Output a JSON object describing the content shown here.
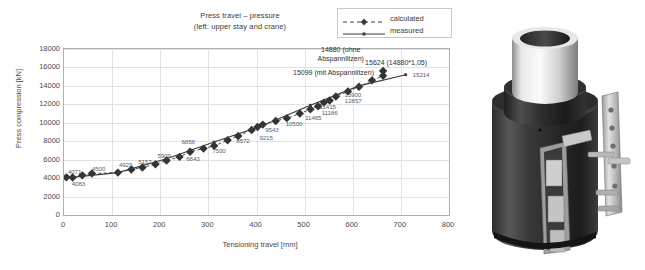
{
  "chart_data": {
    "type": "line",
    "title": "Press travel – pressure",
    "subtitle": "(left: upper stay and crane)",
    "xlabel": "Tensioning travel [mm]",
    "ylabel": "Press compression [kN]",
    "xlim": [
      0,
      800
    ],
    "ylim": [
      0,
      18000
    ],
    "xticks": [
      0,
      100,
      200,
      300,
      400,
      500,
      600,
      700,
      800
    ],
    "yticks": [
      0,
      2000,
      4000,
      6000,
      8000,
      10000,
      12000,
      14000,
      16000,
      18000
    ],
    "grid": true,
    "legend_position": "top-right",
    "series": [
      {
        "name": "calculated",
        "style": "dashed-diamond",
        "points": [
          {
            "x": 5,
            "y": 4083
          },
          {
            "x": 18,
            "y": 4071
          },
          {
            "x": 38,
            "y": 4300
          },
          {
            "x": 58,
            "y": 4500
          },
          {
            "x": 112,
            "y": 4600
          },
          {
            "x": 140,
            "y": 4929
          },
          {
            "x": 163,
            "y": 5157
          },
          {
            "x": 190,
            "y": 5500
          },
          {
            "x": 213,
            "y": 5909
          },
          {
            "x": 240,
            "y": 6300
          },
          {
            "x": 262,
            "y": 6858
          },
          {
            "x": 290,
            "y": 7200
          },
          {
            "x": 312,
            "y": 7500
          },
          {
            "x": 340,
            "y": 8100
          },
          {
            "x": 362,
            "y": 8572
          },
          {
            "x": 390,
            "y": 9215
          },
          {
            "x": 402,
            "y": 9543
          },
          {
            "x": 413,
            "y": 9800
          },
          {
            "x": 440,
            "y": 10200
          },
          {
            "x": 463,
            "y": 10500
          },
          {
            "x": 490,
            "y": 11000
          },
          {
            "x": 512,
            "y": 11465
          },
          {
            "x": 528,
            "y": 11800
          },
          {
            "x": 540,
            "y": 12186
          },
          {
            "x": 552,
            "y": 12415
          },
          {
            "x": 565,
            "y": 12857
          },
          {
            "x": 590,
            "y": 13400
          },
          {
            "x": 613,
            "y": 13900
          },
          {
            "x": 640,
            "y": 14600
          },
          {
            "x": 663,
            "y": 15099
          },
          {
            "x": 663,
            "y": 15624
          }
        ]
      },
      {
        "name": "measured",
        "style": "solid-line",
        "points": [
          {
            "x": 0,
            "y": 4000
          },
          {
            "x": 112,
            "y": 4600
          },
          {
            "x": 213,
            "y": 6100
          },
          {
            "x": 312,
            "y": 7900
          },
          {
            "x": 413,
            "y": 9700
          },
          {
            "x": 512,
            "y": 11900
          },
          {
            "x": 613,
            "y": 14000
          },
          {
            "x": 710,
            "y": 15214
          }
        ]
      }
    ],
    "data_labels": [
      {
        "text": "4071",
        "x": 22,
        "y": 4800
      },
      {
        "text": "4083",
        "x": 30,
        "y": 3500
      },
      {
        "text": "4500",
        "x": 72,
        "y": 5100
      },
      {
        "text": "4929",
        "x": 128,
        "y": 5500
      },
      {
        "text": "5157",
        "x": 168,
        "y": 5900
      },
      {
        "text": "5909",
        "x": 208,
        "y": 6500
      },
      {
        "text": "6858",
        "x": 258,
        "y": 8000
      },
      {
        "text": "6643",
        "x": 268,
        "y": 6200
      },
      {
        "text": "7500",
        "x": 322,
        "y": 7100
      },
      {
        "text": "8572",
        "x": 372,
        "y": 8100
      },
      {
        "text": "9215",
        "x": 420,
        "y": 8500
      },
      {
        "text": "9543",
        "x": 432,
        "y": 9300
      },
      {
        "text": "10500",
        "x": 478,
        "y": 10000
      },
      {
        "text": "11465",
        "x": 518,
        "y": 10600
      },
      {
        "text": "11186",
        "x": 552,
        "y": 11200
      },
      {
        "text": "11415",
        "x": 548,
        "y": 11800
      },
      {
        "text": "13900",
        "x": 600,
        "y": 13100
      },
      {
        "text": "12857",
        "x": 601,
        "y": 12500
      },
      {
        "text": "15214",
        "x": 742,
        "y": 15250
      }
    ],
    "annotations": [
      {
        "text": "14880 (ohne",
        "line2": "Abspannlitzen)",
        "x": 575,
        "y": 17500
      },
      {
        "text": "15624 (14880*1,05)",
        "x": 690,
        "y": 16550
      },
      {
        "text": "15099 (mit Abspannlitzen)",
        "x": 560,
        "y": 15500
      }
    ]
  },
  "legend": {
    "items": [
      {
        "label": "calculated",
        "style": "dashed-diamond"
      },
      {
        "label": "measured",
        "style": "solid-line"
      }
    ]
  },
  "photo": {
    "caption": "",
    "alt_name": "hydraulic-press-cylinder-photo"
  }
}
